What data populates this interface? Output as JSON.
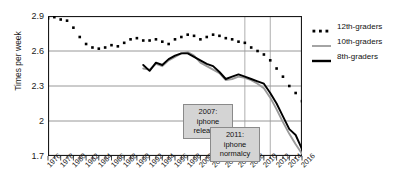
{
  "chart_data": {
    "type": "line",
    "title": "",
    "xlabel": "",
    "ylabel": "Times per week",
    "xlim": [
      1976,
      2016
    ],
    "ylim": [
      1.7,
      2.9
    ],
    "yticks": [
      "2.9",
      "2.6",
      "2.3",
      "2",
      "1.7"
    ],
    "ytick_values": [
      2.9,
      2.6,
      2.3,
      2.0,
      1.7
    ],
    "xticks": [
      "1976",
      "1978",
      "1980",
      "1982",
      "1984",
      "1986",
      "1988",
      "1990",
      "1992",
      "1994",
      "1996",
      "1998",
      "2000",
      "2002",
      "2004",
      "2006",
      "2008",
      "2010",
      "2012",
      "2014",
      "2016"
    ],
    "grid": true,
    "legend_position": "right",
    "series": [
      {
        "name": "12th-graders",
        "style": "dotted",
        "color": "#000000",
        "x": [
          1976,
          1977,
          1978,
          1979,
          1980,
          1981,
          1982,
          1983,
          1984,
          1985,
          1986,
          1987,
          1988,
          1989,
          1990,
          1991,
          1992,
          1993,
          1994,
          1995,
          1996,
          1997,
          1998,
          1999,
          2000,
          2001,
          2002,
          2003,
          2004,
          2005,
          2006,
          2007,
          2008,
          2009,
          2010,
          2011,
          2012,
          2013,
          2014,
          2015,
          2016
        ],
        "y": [
          2.88,
          2.89,
          2.87,
          2.86,
          2.8,
          2.72,
          2.66,
          2.63,
          2.62,
          2.63,
          2.65,
          2.64,
          2.67,
          2.7,
          2.71,
          2.69,
          2.69,
          2.7,
          2.68,
          2.66,
          2.7,
          2.72,
          2.74,
          2.73,
          2.7,
          2.72,
          2.74,
          2.73,
          2.71,
          2.7,
          2.68,
          2.67,
          2.63,
          2.6,
          2.57,
          2.52,
          2.45,
          2.38,
          2.3,
          2.24,
          2.17
        ]
      },
      {
        "name": "10th-graders",
        "style": "solid",
        "color": "#9a9a9a",
        "x": [
          1991,
          1992,
          1993,
          1994,
          1995,
          1996,
          1997,
          1998,
          1999,
          2000,
          2001,
          2002,
          2003,
          2004,
          2005,
          2006,
          2007,
          2008,
          2009,
          2010,
          2011,
          2012,
          2013,
          2014,
          2015,
          2016
        ],
        "y": [
          2.45,
          2.44,
          2.49,
          2.47,
          2.52,
          2.55,
          2.58,
          2.59,
          2.56,
          2.5,
          2.47,
          2.44,
          2.41,
          2.35,
          2.36,
          2.38,
          2.37,
          2.35,
          2.32,
          2.28,
          2.2,
          2.1,
          1.99,
          1.89,
          1.8,
          1.72
        ]
      },
      {
        "name": "8th-graders",
        "style": "solid",
        "color": "#000000",
        "x": [
          1991,
          1992,
          1993,
          1994,
          1995,
          1996,
          1997,
          1998,
          1999,
          2000,
          2001,
          2002,
          2003,
          2004,
          2005,
          2006,
          2007,
          2008,
          2009,
          2010,
          2011,
          2012,
          2013,
          2014,
          2015,
          2016
        ],
        "y": [
          2.48,
          2.43,
          2.5,
          2.48,
          2.53,
          2.56,
          2.58,
          2.58,
          2.55,
          2.52,
          2.49,
          2.47,
          2.42,
          2.36,
          2.38,
          2.4,
          2.38,
          2.36,
          2.34,
          2.32,
          2.24,
          2.15,
          2.04,
          1.93,
          1.88,
          1.76
        ]
      }
    ],
    "annotations": [
      {
        "id": "annot-0",
        "text": "2007: iphone\nreleased",
        "year": 2007
      },
      {
        "id": "annot-1",
        "text": "2011: iphone\nnormalcy",
        "year": 2011
      }
    ],
    "vlines": [
      2007,
      2011
    ]
  },
  "legend": {
    "items": [
      {
        "label": "12th-graders"
      },
      {
        "label": "10th-graders"
      },
      {
        "label": "8th-graders"
      }
    ]
  }
}
